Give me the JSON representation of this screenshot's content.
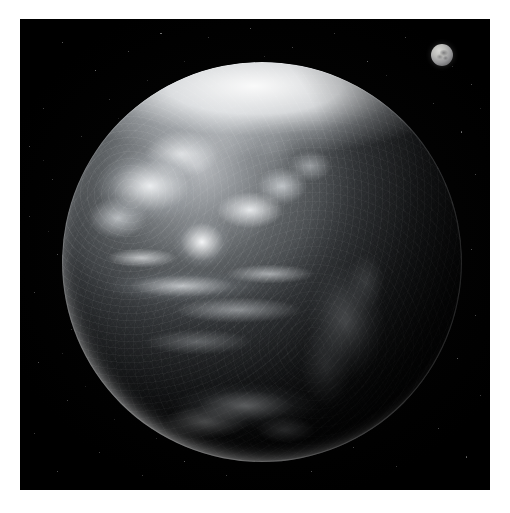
{
  "scene": {
    "title": "Earth and Moon from space",
    "description": "Monochrome satellite photograph of the sunlit Western Hemisphere of Earth with the Moon at upper right against a black star field",
    "frame": {
      "background_color": "#ffffff",
      "border_width_px": 20,
      "photo_x": 20,
      "photo_y": 19,
      "photo_width": 470,
      "photo_height": 471,
      "photo_background_color": "#000000"
    },
    "earth": {
      "label": "Earth",
      "center_x": 262,
      "center_y": 262,
      "radius": 200,
      "hemisphere": "Western",
      "illumination": "sunlit from upper left, terminator on right limb",
      "highlight_color": "#c9ccd0",
      "shadow_color": "#000000",
      "features": [
        {
          "name": "arctic-ice-cap",
          "position": "north polar cap, bright white"
        },
        {
          "name": "north-america",
          "position": "upper left quadrant"
        },
        {
          "name": "south-america",
          "position": "lower right quadrant"
        },
        {
          "name": "pacific-cloud-bands",
          "position": "left and lower left"
        },
        {
          "name": "tropical-cloud-band",
          "position": "equatorial, horizontal streaks"
        },
        {
          "name": "southern-ocean-storm-swirl",
          "position": "lower center"
        },
        {
          "name": "bright-limb-crescent",
          "position": "south-west limb"
        }
      ]
    },
    "moon": {
      "label": "Moon",
      "center_x": 442,
      "center_y": 55,
      "radius": 11,
      "surface_color": "#bdbdba",
      "maria_color": "#56565a"
    },
    "starfield": {
      "label": "Star field",
      "star_color": "#ffffff",
      "count": 74,
      "stars": [
        {
          "x": 0.09,
          "y": 0.05,
          "r": 0.5,
          "o": 0.45
        },
        {
          "x": 0.16,
          "y": 0.11,
          "r": 0.6,
          "o": 0.55
        },
        {
          "x": 0.05,
          "y": 0.19,
          "r": 0.5,
          "o": 0.35
        },
        {
          "x": 0.23,
          "y": 0.07,
          "r": 0.5,
          "o": 0.4
        },
        {
          "x": 0.3,
          "y": 0.03,
          "r": 0.6,
          "o": 0.5
        },
        {
          "x": 0.4,
          "y": 0.04,
          "r": 0.5,
          "o": 0.3
        },
        {
          "x": 0.49,
          "y": 0.02,
          "r": 0.6,
          "o": 0.45
        },
        {
          "x": 0.58,
          "y": 0.06,
          "r": 0.5,
          "o": 0.35
        },
        {
          "x": 0.67,
          "y": 0.03,
          "r": 0.5,
          "o": 0.3
        },
        {
          "x": 0.74,
          "y": 0.09,
          "r": 0.6,
          "o": 0.5
        },
        {
          "x": 0.82,
          "y": 0.04,
          "r": 0.5,
          "o": 0.35
        },
        {
          "x": 0.91,
          "y": 0.07,
          "r": 0.7,
          "o": 0.6
        },
        {
          "x": 0.96,
          "y": 0.14,
          "r": 0.5,
          "o": 0.4
        },
        {
          "x": 0.88,
          "y": 0.18,
          "r": 0.5,
          "o": 0.3
        },
        {
          "x": 0.94,
          "y": 0.24,
          "r": 0.6,
          "o": 0.45
        },
        {
          "x": 0.97,
          "y": 0.33,
          "r": 0.5,
          "o": 0.35
        },
        {
          "x": 0.92,
          "y": 0.41,
          "r": 0.5,
          "o": 0.3
        },
        {
          "x": 0.96,
          "y": 0.49,
          "r": 0.6,
          "o": 0.4
        },
        {
          "x": 0.9,
          "y": 0.56,
          "r": 0.5,
          "o": 0.28
        },
        {
          "x": 0.97,
          "y": 0.63,
          "r": 0.5,
          "o": 0.35
        },
        {
          "x": 0.93,
          "y": 0.72,
          "r": 0.6,
          "o": 0.45
        },
        {
          "x": 0.98,
          "y": 0.8,
          "r": 0.5,
          "o": 0.32
        },
        {
          "x": 0.89,
          "y": 0.87,
          "r": 0.5,
          "o": 0.38
        },
        {
          "x": 0.95,
          "y": 0.93,
          "r": 0.6,
          "o": 0.42
        },
        {
          "x": 0.8,
          "y": 0.95,
          "r": 0.5,
          "o": 0.3
        },
        {
          "x": 0.71,
          "y": 0.91,
          "r": 0.5,
          "o": 0.35
        },
        {
          "x": 0.62,
          "y": 0.96,
          "r": 0.6,
          "o": 0.4
        },
        {
          "x": 0.53,
          "y": 0.93,
          "r": 0.5,
          "o": 0.28
        },
        {
          "x": 0.44,
          "y": 0.97,
          "r": 0.5,
          "o": 0.33
        },
        {
          "x": 0.35,
          "y": 0.94,
          "r": 0.6,
          "o": 0.45
        },
        {
          "x": 0.26,
          "y": 0.97,
          "r": 0.5,
          "o": 0.3
        },
        {
          "x": 0.17,
          "y": 0.92,
          "r": 0.5,
          "o": 0.35
        },
        {
          "x": 0.08,
          "y": 0.96,
          "r": 0.6,
          "o": 0.4
        },
        {
          "x": 0.03,
          "y": 0.88,
          "r": 0.5,
          "o": 0.3
        },
        {
          "x": 0.1,
          "y": 0.81,
          "r": 0.5,
          "o": 0.35
        },
        {
          "x": 0.04,
          "y": 0.73,
          "r": 0.6,
          "o": 0.42
        },
        {
          "x": 0.11,
          "y": 0.66,
          "r": 0.5,
          "o": 0.28
        },
        {
          "x": 0.03,
          "y": 0.58,
          "r": 0.5,
          "o": 0.35
        },
        {
          "x": 0.08,
          "y": 0.5,
          "r": 0.6,
          "o": 0.4
        },
        {
          "x": 0.02,
          "y": 0.42,
          "r": 0.5,
          "o": 0.3
        },
        {
          "x": 0.07,
          "y": 0.34,
          "r": 0.5,
          "o": 0.33
        },
        {
          "x": 0.02,
          "y": 0.27,
          "r": 0.6,
          "o": 0.38
        },
        {
          "x": 0.13,
          "y": 0.25,
          "r": 0.5,
          "o": 0.28
        },
        {
          "x": 0.19,
          "y": 0.17,
          "r": 0.5,
          "o": 0.32
        },
        {
          "x": 0.27,
          "y": 0.13,
          "r": 0.4,
          "o": 0.26
        },
        {
          "x": 0.35,
          "y": 0.09,
          "r": 0.4,
          "o": 0.24
        },
        {
          "x": 0.44,
          "y": 0.11,
          "r": 0.4,
          "o": 0.22
        },
        {
          "x": 0.52,
          "y": 0.08,
          "r": 0.4,
          "o": 0.26
        },
        {
          "x": 0.62,
          "y": 0.11,
          "r": 0.4,
          "o": 0.24
        },
        {
          "x": 0.7,
          "y": 0.15,
          "r": 0.4,
          "o": 0.22
        },
        {
          "x": 0.78,
          "y": 0.12,
          "r": 0.4,
          "o": 0.26
        },
        {
          "x": 0.85,
          "y": 0.29,
          "r": 0.4,
          "o": 0.24
        },
        {
          "x": 0.88,
          "y": 0.37,
          "r": 0.4,
          "o": 0.2
        },
        {
          "x": 0.84,
          "y": 0.45,
          "r": 0.4,
          "o": 0.22
        },
        {
          "x": 0.87,
          "y": 0.68,
          "r": 0.4,
          "o": 0.24
        },
        {
          "x": 0.83,
          "y": 0.77,
          "r": 0.4,
          "o": 0.22
        },
        {
          "x": 0.76,
          "y": 0.84,
          "r": 0.4,
          "o": 0.2
        },
        {
          "x": 0.66,
          "y": 0.86,
          "r": 0.4,
          "o": 0.22
        },
        {
          "x": 0.57,
          "y": 0.89,
          "r": 0.4,
          "o": 0.2
        },
        {
          "x": 0.47,
          "y": 0.88,
          "r": 0.4,
          "o": 0.22
        },
        {
          "x": 0.38,
          "y": 0.87,
          "r": 0.4,
          "o": 0.2
        },
        {
          "x": 0.29,
          "y": 0.89,
          "r": 0.4,
          "o": 0.24
        },
        {
          "x": 0.2,
          "y": 0.85,
          "r": 0.4,
          "o": 0.22
        },
        {
          "x": 0.14,
          "y": 0.78,
          "r": 0.4,
          "o": 0.2
        },
        {
          "x": 0.09,
          "y": 0.71,
          "r": 0.4,
          "o": 0.24
        },
        {
          "x": 0.15,
          "y": 0.62,
          "r": 0.4,
          "o": 0.22
        },
        {
          "x": 0.1,
          "y": 0.55,
          "r": 0.4,
          "o": 0.2
        },
        {
          "x": 0.06,
          "y": 0.45,
          "r": 0.4,
          "o": 0.22
        },
        {
          "x": 0.12,
          "y": 0.38,
          "r": 0.4,
          "o": 0.2
        },
        {
          "x": 0.05,
          "y": 0.3,
          "r": 0.4,
          "o": 0.22
        },
        {
          "x": 0.21,
          "y": 0.21,
          "r": 0.4,
          "o": 0.2
        },
        {
          "x": 0.66,
          "y": 0.19,
          "r": 0.4,
          "o": 0.22
        },
        {
          "x": 0.92,
          "y": 0.1,
          "r": 0.4,
          "o": 0.28
        },
        {
          "x": 0.98,
          "y": 0.19,
          "r": 0.4,
          "o": 0.22
        }
      ]
    }
  }
}
